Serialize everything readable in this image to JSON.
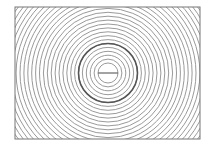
{
  "diagram": {
    "type": "concentric-circles",
    "frame": {
      "x": 15,
      "y": 7,
      "width": 185,
      "height": 132,
      "stroke": "#777777"
    },
    "center": {
      "x": 108,
      "y": 73
    },
    "inner_circle": {
      "radius": 10,
      "has_diameter_line": true
    },
    "ring_spacing": 3.9,
    "ring_count": 28,
    "highlighted_ring": {
      "radius": 29.5,
      "stroke": "#555555",
      "width": 1.6
    },
    "ring_stroke": "#9a9a9a",
    "background": "#ffffff"
  }
}
